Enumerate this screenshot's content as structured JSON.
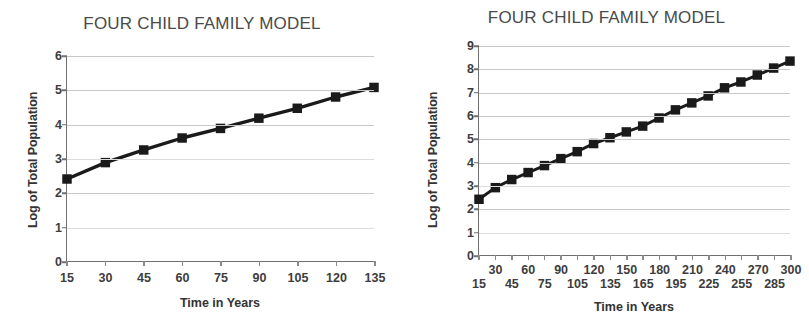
{
  "charts": [
    {
      "panel": "left",
      "title": "FOUR CHILD FAMILY MODEL",
      "xlabel": "Time in Years",
      "ylabel": "Log of Total Population"
    },
    {
      "panel": "right",
      "title": "FOUR CHILD FAMILY MODEL",
      "xlabel": "Time in Years",
      "ylabel": "Log of Total Population"
    }
  ],
  "chart_data": [
    {
      "type": "line",
      "title": "FOUR CHILD FAMILY MODEL",
      "xlabel": "Time in Years",
      "ylabel": "Log of Total Population",
      "x": [
        15,
        30,
        45,
        60,
        75,
        90,
        105,
        120,
        135
      ],
      "values": [
        2.4,
        2.88,
        3.25,
        3.6,
        3.88,
        4.18,
        4.47,
        4.8,
        5.08
      ],
      "xticklabels": [
        "15",
        "30",
        "45",
        "60",
        "75",
        "90",
        "105",
        "120",
        "135"
      ],
      "yticklabels": [
        "0",
        "1",
        "2",
        "3",
        "4",
        "5",
        "6"
      ],
      "xlim": [
        15,
        135
      ],
      "ylim": [
        0,
        6
      ],
      "grid": true,
      "legend": false,
      "marker": "square",
      "color": "#1a1a1a"
    },
    {
      "type": "line",
      "title": "FOUR CHILD FAMILY MODEL",
      "xlabel": "Time in Years",
      "ylabel": "Log of Total Population",
      "x": [
        15,
        30,
        45,
        60,
        75,
        90,
        105,
        120,
        135,
        150,
        165,
        180,
        195,
        210,
        225,
        240,
        255,
        270,
        285,
        300
      ],
      "values": [
        2.4,
        2.9,
        3.25,
        3.55,
        3.85,
        4.15,
        4.45,
        4.8,
        5.05,
        5.3,
        5.55,
        5.9,
        6.25,
        6.55,
        6.85,
        7.2,
        7.45,
        7.75,
        8.05,
        8.35
      ],
      "xticklabels_top": [
        "30",
        "60",
        "90",
        "120",
        "150",
        "180",
        "210",
        "240",
        "270",
        "300"
      ],
      "xticklabels_bottom": [
        "15",
        "45",
        "75",
        "105",
        "135",
        "165",
        "195",
        "225",
        "255",
        "285"
      ],
      "yticklabels": [
        "0",
        "1",
        "2",
        "3",
        "4",
        "5",
        "6",
        "7",
        "8",
        "9"
      ],
      "xlim": [
        15,
        300
      ],
      "ylim": [
        0,
        9
      ],
      "grid": true,
      "legend": false,
      "marker": "square",
      "color": "#1a1a1a"
    }
  ]
}
